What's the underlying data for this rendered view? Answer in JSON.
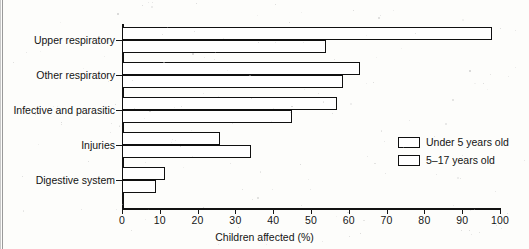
{
  "chart_data": {
    "type": "bar",
    "orientation": "horizontal",
    "title": "",
    "xlabel": "Children affected (%)",
    "ylabel": "",
    "xlim": [
      0,
      100
    ],
    "xticks": [
      0,
      10,
      20,
      30,
      40,
      50,
      60,
      70,
      80,
      90,
      100
    ],
    "xtick_labels": [
      "0",
      "10",
      "20",
      "30",
      "40",
      "50",
      "60",
      "70",
      "80",
      "90",
      "100"
    ],
    "grid": false,
    "legend_position": "center-right",
    "categories": [
      "Upper respiratory",
      "Other respiratory",
      "Infective and parasitic",
      "Injuries",
      "Digestive system"
    ],
    "series": [
      {
        "name": "Under 5 years old",
        "values": [
          98,
          63,
          57,
          26,
          11.5
        ]
      },
      {
        "name": "5–17 years old",
        "values": [
          54,
          58.5,
          45,
          34,
          9
        ]
      }
    ],
    "bar_color": "#ffffff",
    "bar_edge_color": "#101010"
  },
  "legend": {
    "items": [
      {
        "label": "Under 5 years old"
      },
      {
        "label": "5–17 years old"
      }
    ]
  }
}
